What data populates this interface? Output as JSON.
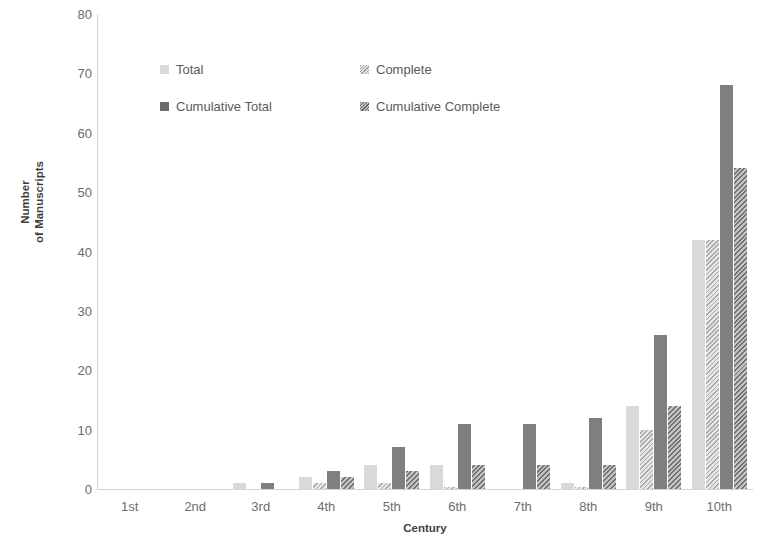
{
  "chart_data": {
    "type": "bar",
    "title": "",
    "xlabel": "Century",
    "ylabel_line1": "Number",
    "ylabel_line2": "of Manuscripts",
    "ylabel": "Number of Manuscripts",
    "categories": [
      "1st",
      "2nd",
      "3rd",
      "4th",
      "5th",
      "6th",
      "7th",
      "8th",
      "9th",
      "10th"
    ],
    "ylim": [
      0,
      80
    ],
    "yticks": [
      0,
      10,
      20,
      30,
      40,
      50,
      60,
      70,
      80
    ],
    "ytick_labels": [
      "0",
      "10",
      "20",
      "30",
      "40",
      "50",
      "60",
      "70",
      "80"
    ],
    "grid": false,
    "legend_position": "upper-left-inside",
    "series": [
      {
        "name": "Total",
        "key": "total",
        "color": "#d9d9d9",
        "pattern": "solid",
        "values": [
          0,
          0,
          1,
          2,
          4,
          4,
          0,
          1,
          14,
          42
        ]
      },
      {
        "name": "Complete",
        "key": "complete",
        "color": "#d9d9d9",
        "pattern": "diagonal-hatch",
        "values": [
          0,
          0,
          0,
          1,
          1,
          0.4,
          0,
          0.4,
          10,
          42
        ]
      },
      {
        "name": "Cumulative Total",
        "key": "cumulative_total",
        "color": "#7f7f7f",
        "pattern": "solid",
        "values": [
          0,
          0,
          1,
          3,
          7,
          11,
          11,
          12,
          26,
          68
        ]
      },
      {
        "name": "Cumulative Complete",
        "key": "cumulative_complete",
        "color": "#a6a6a6",
        "pattern": "diagonal-hatch",
        "values": [
          0,
          0,
          0,
          2,
          3,
          4,
          4,
          4,
          14,
          54
        ]
      }
    ]
  },
  "legend": {
    "entries": [
      {
        "label": "Total",
        "swatch": "sw-total"
      },
      {
        "label": "Complete",
        "swatch": "sw-complete"
      },
      {
        "label": "Cumulative Total",
        "swatch": "sw-cum-total"
      },
      {
        "label": "Cumulative Complete",
        "swatch": "sw-cum-complete"
      }
    ]
  }
}
